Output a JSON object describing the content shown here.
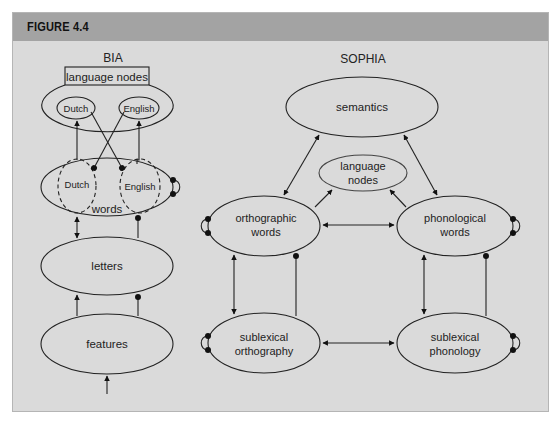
{
  "figure": {
    "title": "FIGURE 4.4"
  },
  "bia": {
    "title": "BIA",
    "language_nodes_label": "language nodes",
    "nodes": {
      "dutch_lang": "Dutch",
      "english_lang": "English",
      "dutch_words": "Dutch",
      "english_words": "English",
      "words": "words",
      "letters": "letters",
      "features": "features"
    }
  },
  "sophia": {
    "title": "SOPHIA",
    "nodes": {
      "semantics": "semantics",
      "language_nodes_line1": "language",
      "language_nodes_line2": "nodes",
      "orthographic_words_line1": "orthographic",
      "orthographic_words_line2": "words",
      "phonological_words_line1": "phonological",
      "phonological_words_line2": "words",
      "sublexical_orthography_line1": "sublexical",
      "sublexical_orthography_line2": "orthography",
      "sublexical_phonology_line1": "sublexical",
      "sublexical_phonology_line2": "phonology"
    }
  }
}
